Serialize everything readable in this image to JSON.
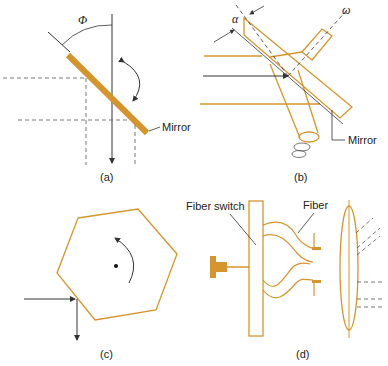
{
  "colors": {
    "orange": "#d4952f",
    "line": "#333333",
    "dash": "#555555"
  },
  "panels": {
    "a": {
      "caption": "(a)",
      "angle_label": "Φ",
      "mirror_label": "Mirror"
    },
    "b": {
      "caption": "(b)",
      "angle_label": "α",
      "rotation_label": "ω",
      "mirror_label": "Mirror"
    },
    "c": {
      "caption": "(c)"
    },
    "d": {
      "caption": "(d)",
      "switch_label": "Fiber switch",
      "fiber_label": "Fiber"
    }
  }
}
